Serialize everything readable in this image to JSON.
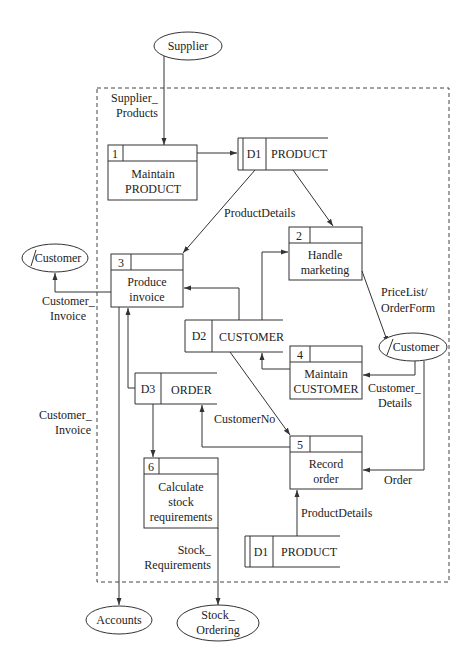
{
  "diagram": {
    "type": "data-flow-diagram",
    "boundary": "system-boundary-dashed",
    "external_entities": [
      {
        "id": "supplier",
        "label": "Supplier"
      },
      {
        "id": "customer_left",
        "label": "Customer",
        "duplicate_mark": true
      },
      {
        "id": "customer_right",
        "label": "Customer",
        "duplicate_mark": true
      },
      {
        "id": "accounts",
        "label": "Accounts"
      },
      {
        "id": "stock_ordering",
        "label_line1": "Stock_",
        "label_line2": "Ordering"
      }
    ],
    "processes": [
      {
        "num": "1",
        "line1": "Maintain",
        "line2": "PRODUCT"
      },
      {
        "num": "2",
        "line1": "Handle",
        "line2": "marketing"
      },
      {
        "num": "3",
        "line1": "Produce",
        "line2": "invoice"
      },
      {
        "num": "4",
        "line1": "Maintain",
        "line2": "CUSTOMER"
      },
      {
        "num": "5",
        "line1": "Record",
        "line2": "order"
      },
      {
        "num": "6",
        "line1": "Calculate",
        "line2": "stock",
        "line3": "requirements"
      }
    ],
    "data_stores": [
      {
        "id": "D1",
        "name": "PRODUCT"
      },
      {
        "id": "D2",
        "name": "CUSTOMER"
      },
      {
        "id": "D3",
        "name": "ORDER"
      },
      {
        "id": "D1",
        "name": "PRODUCT",
        "duplicate": true
      }
    ],
    "flows": [
      {
        "line1": "Supplier_",
        "line2": "Products"
      },
      {
        "label": "ProductDetails"
      },
      {
        "line1": "Customer_",
        "line2": "Invoice"
      },
      {
        "line1": "PriceList/",
        "line2": "OrderForm"
      },
      {
        "line1": "Customer_",
        "line2": "Details"
      },
      {
        "line1": "Customer_",
        "line2": "Invoice"
      },
      {
        "label": "CustomerNo"
      },
      {
        "label": "Order"
      },
      {
        "label": "ProductDetails"
      },
      {
        "line1": "Stock_",
        "line2": "Requirements"
      }
    ]
  }
}
